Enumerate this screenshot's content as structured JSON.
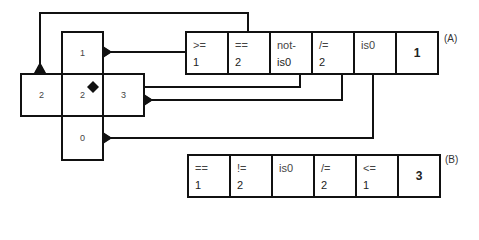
{
  "cross_grid": {
    "top": "1",
    "left": "2",
    "center": "2",
    "right": "3",
    "bottom": "0"
  },
  "table_a": {
    "label": "(A)",
    "cells": [
      {
        "op": ">=",
        "val": "1"
      },
      {
        "op": "==",
        "val": "2"
      },
      {
        "op": "not-",
        "val": "is0"
      },
      {
        "op": "/=",
        "val": "2"
      },
      {
        "op": "is0",
        "val": ""
      }
    ],
    "result": "1"
  },
  "table_b": {
    "label": "(B)",
    "cells": [
      {
        "op": "==",
        "val": "1"
      },
      {
        "op": "!=",
        "val": "2"
      },
      {
        "op": "is0",
        "val": ""
      },
      {
        "op": "/=",
        "val": "2"
      },
      {
        "op": "<=",
        "val": "1"
      }
    ],
    "result": "3"
  },
  "colors": {
    "line": "#111111",
    "background": "#ffffff"
  }
}
